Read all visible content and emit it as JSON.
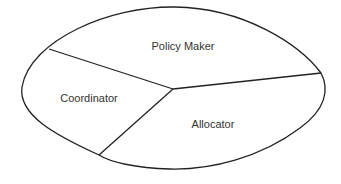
{
  "diagram": {
    "shape": "lens",
    "stroke_color": "#222222",
    "background": "#ffffff",
    "regions": [
      {
        "id": "policy-maker",
        "label": "Policy Maker"
      },
      {
        "id": "coordinator",
        "label": "Coordinator"
      },
      {
        "id": "allocator",
        "label": "Allocator"
      }
    ]
  }
}
